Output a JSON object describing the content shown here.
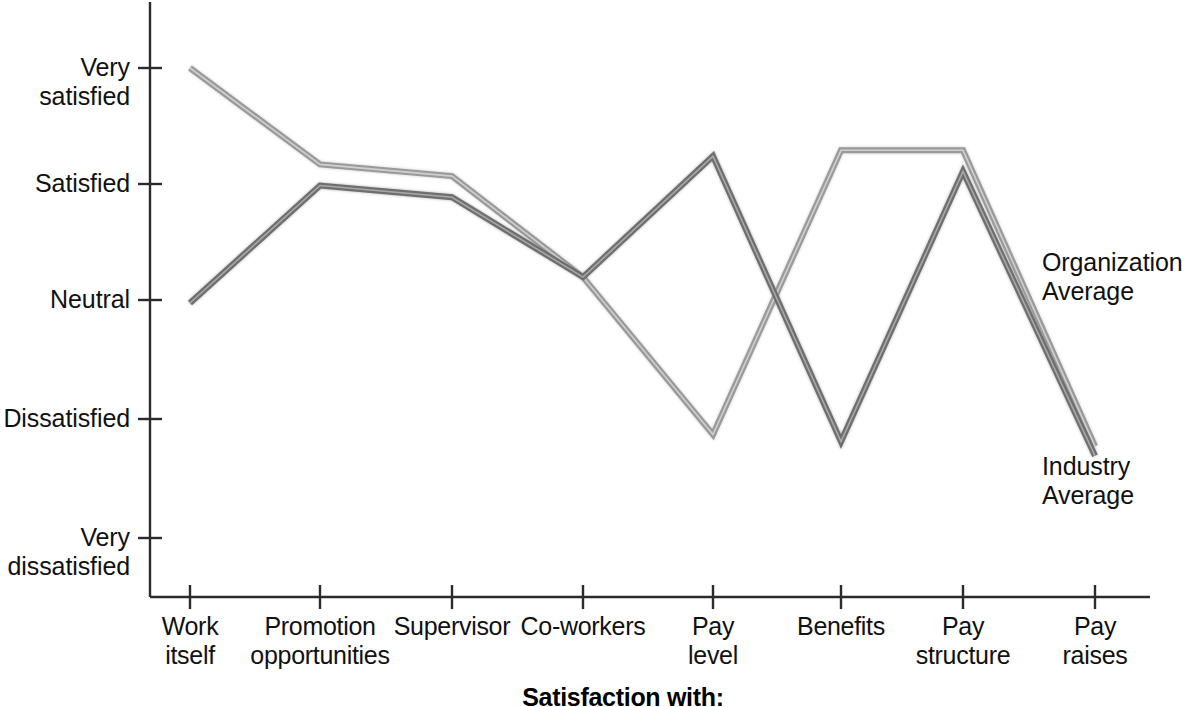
{
  "figure": {
    "top_cut_text": "Employee satisfaction survey results",
    "xaxis_title": "Satisfaction with:"
  },
  "chart_data": {
    "type": "line",
    "title": "",
    "xlabel": "Satisfaction with:",
    "ylabel": "",
    "grid": false,
    "legend_position": "right-inline",
    "categories": [
      "Work\nitself",
      "Promotion\nopportunities",
      "Supervisor",
      "Co-workers",
      "Pay\nlevel",
      "Benefits",
      "Pay\nstructure",
      "Pay\nraises"
    ],
    "categories_flat": [
      "Work itself",
      "Promotion opportunities",
      "Supervisor",
      "Co-workers",
      "Pay level",
      "Benefits",
      "Pay structure",
      "Pay raises"
    ],
    "ytick_labels": [
      "Very\nsatisfied",
      "Satisfied",
      "Neutral",
      "Dissatisfied",
      "Very\ndissatisfied"
    ],
    "ytick_values": [
      5,
      4,
      3,
      2,
      1
    ],
    "ylim": [
      0.6,
      5.3
    ],
    "series": [
      {
        "name": "Organization\nAverage",
        "name_flat": "Organization Average",
        "color": "#9a9a9a",
        "values": [
          5.0,
          4.18,
          4.08,
          3.22,
          1.88,
          4.3,
          4.3,
          1.78
        ]
      },
      {
        "name": "Industry\nAverage",
        "name_flat": "Industry Average",
        "color": "#6e6e6e",
        "values": [
          3.0,
          4.0,
          3.9,
          3.22,
          4.25,
          1.82,
          4.12,
          1.7
        ]
      }
    ]
  }
}
